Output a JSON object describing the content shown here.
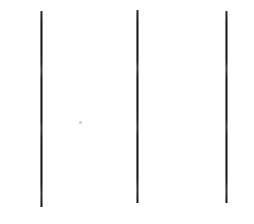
{
  "canvas": {
    "width": 254,
    "height": 224,
    "background_color": "#ffffff",
    "description": "Three near-vertical black strokes on a plain white background"
  },
  "drawing": {
    "stroke_color": "#1a1a1a",
    "stroke_count": 3,
    "strokes": [
      {
        "name": "left-vertical-line",
        "x": 40,
        "y": 11,
        "width": 3,
        "height": 196
      },
      {
        "name": "middle-vertical-line",
        "x": 136,
        "y": 10,
        "width": 3,
        "height": 193
      },
      {
        "name": "right-vertical-line",
        "x": 225,
        "y": 11,
        "width": 3,
        "height": 192
      }
    ],
    "marks": [
      {
        "name": "faint-speck",
        "x": 79,
        "y": 121,
        "width": 3,
        "height": 3,
        "color": "#cdcdd2"
      }
    ]
  }
}
